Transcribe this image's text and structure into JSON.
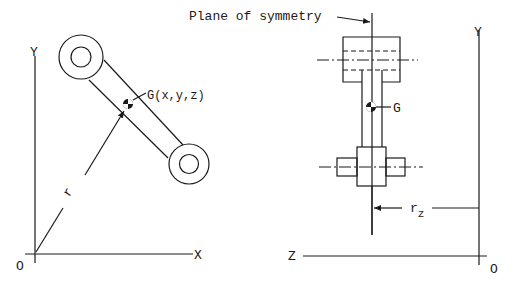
{
  "figure": {
    "left_view": {
      "axis_y_label": "Y",
      "axis_x_label": "X",
      "origin_label": "O",
      "cg_label": "G(x,y,z)",
      "radius_label": "r"
    },
    "right_view": {
      "plane_label": "Plane of symmetry",
      "cg_label": "G",
      "axis_y_label": "Y",
      "axis_z_label": "Z",
      "origin_label": "O",
      "radius_label": "r",
      "radius_subscript": "z"
    },
    "colors": {
      "ink": "#1a1a1a",
      "background": "#ffffff"
    }
  }
}
